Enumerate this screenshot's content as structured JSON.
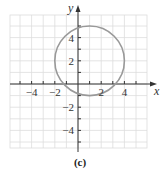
{
  "chart_data": {
    "type": "line",
    "title": "",
    "caption": "(c)",
    "xlabel": "x",
    "ylabel": "y",
    "xlim": [
      -5.9,
      6
    ],
    "ylim": [
      -5.9,
      6
    ],
    "grid": true,
    "x_tick_labels": [
      "−4",
      "−2",
      "2",
      "4"
    ],
    "x_tick_values": [
      -4,
      -2,
      2,
      4
    ],
    "y_tick_labels": [
      "4",
      "2",
      "−2",
      "−4"
    ],
    "y_tick_values": [
      4,
      2,
      -2,
      -4
    ],
    "series": [
      {
        "name": "circle",
        "shape": "circle",
        "center": [
          1,
          2
        ],
        "radius": 3,
        "color": "#999999"
      }
    ]
  },
  "colors": {
    "axis": "#333333",
    "grid": "#dddddd",
    "curve": "#999999"
  }
}
